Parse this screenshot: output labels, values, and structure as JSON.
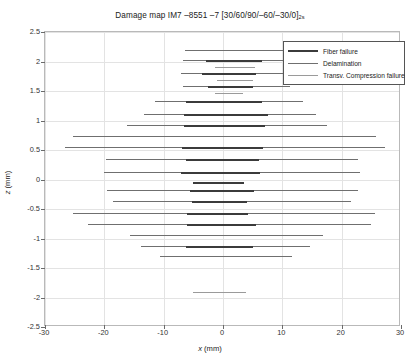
{
  "chart_data": {
    "type": "line",
    "title": "Damage map IM7 –8551 –7 [30/60/90/–60/–30/0]",
    "title_subscript": "2s",
    "xlabel": "x (mm)",
    "ylabel": "z (mm)",
    "xlim": [
      -30,
      30
    ],
    "ylim": [
      -2.5,
      2.5
    ],
    "xticks": [
      -30,
      -20,
      -10,
      0,
      10,
      20,
      30
    ],
    "yticks": [
      2.5,
      2,
      1.5,
      1,
      0.5,
      0,
      -0.5,
      -1,
      -1.5,
      -2,
      -2.5
    ],
    "xticklabels": [
      "-30",
      "-20",
      "-10",
      "0",
      "10",
      "20",
      "30"
    ],
    "yticklabels": [
      "2.5",
      "2",
      "1.5",
      "1",
      "0.5",
      "0",
      "-0.5",
      "-1",
      "-1.5",
      "-2",
      "-2.5"
    ],
    "grid": true,
    "legend_position": "upper right",
    "legend": [
      {
        "label": "Fiber failure",
        "key": "fiber",
        "color": "#3b3b3b",
        "width": 2
      },
      {
        "label": "Delamination",
        "key": "delam",
        "color": "#6f6f6f",
        "width": 1
      },
      {
        "label": "Transv. Compression failure",
        "key": "trans",
        "color": "#9a9a9a",
        "width": 1
      }
    ],
    "segments": [
      {
        "series": "delam",
        "z": 2.19,
        "x0": -6.4,
        "x1": 11.5
      },
      {
        "series": "delam",
        "z": 2.02,
        "x0": -6.7,
        "x1": 11.4
      },
      {
        "series": "fiber",
        "z": 2.02,
        "x0": -2.9,
        "x1": 6.5
      },
      {
        "series": "trans",
        "z": 1.9,
        "x0": -1.4,
        "x1": 5.4
      },
      {
        "series": "delam",
        "z": 1.8,
        "x0": -7.0,
        "x1": 11.3
      },
      {
        "series": "fiber",
        "z": 1.8,
        "x0": -3.6,
        "x1": 5.6
      },
      {
        "series": "trans",
        "z": 1.68,
        "x0": -1.0,
        "x1": 5.1
      },
      {
        "series": "delam",
        "z": 1.58,
        "x0": -6.8,
        "x1": 11.3
      },
      {
        "series": "fiber",
        "z": 1.58,
        "x0": -2.5,
        "x1": 5.1
      },
      {
        "series": "trans",
        "z": 1.47,
        "x0": -1.3,
        "x1": 3.3
      },
      {
        "series": "delam",
        "z": 1.33,
        "x0": -11.5,
        "x1": 13.5
      },
      {
        "series": "fiber",
        "z": 1.33,
        "x0": -6.3,
        "x1": 6.6
      },
      {
        "series": "delam",
        "z": 1.11,
        "x0": -13.3,
        "x1": 15.7
      },
      {
        "series": "fiber",
        "z": 1.11,
        "x0": -6.6,
        "x1": 7.6
      },
      {
        "series": "delam",
        "z": 0.92,
        "x0": -16.1,
        "x1": 17.5
      },
      {
        "series": "fiber",
        "z": 0.92,
        "x0": -6.5,
        "x1": 7.0
      },
      {
        "series": "delam",
        "z": 0.74,
        "x0": -25.3,
        "x1": 25.8
      },
      {
        "series": "delam",
        "z": 0.55,
        "x0": -26.6,
        "x1": 27.3
      },
      {
        "series": "fiber",
        "z": 0.55,
        "x0": -6.9,
        "x1": 6.7
      },
      {
        "series": "delam",
        "z": 0.34,
        "x0": -19.8,
        "x1": 22.8
      },
      {
        "series": "fiber",
        "z": 0.34,
        "x0": -6.3,
        "x1": 6.1
      },
      {
        "series": "delam",
        "z": 0.13,
        "x0": -20.0,
        "x1": 23.1
      },
      {
        "series": "fiber",
        "z": 0.13,
        "x0": -7.1,
        "x1": 6.2
      },
      {
        "series": "fiber",
        "z": -0.05,
        "x0": -5.0,
        "x1": 3.6
      },
      {
        "series": "delam",
        "z": -0.18,
        "x0": -19.6,
        "x1": 22.7
      },
      {
        "series": "fiber",
        "z": -0.18,
        "x0": -5.5,
        "x1": 5.3
      },
      {
        "series": "delam",
        "z": -0.37,
        "x0": -18.5,
        "x1": 21.5
      },
      {
        "series": "fiber",
        "z": -0.37,
        "x0": -5.2,
        "x1": 4.0
      },
      {
        "series": "delam",
        "z": -0.57,
        "x0": -25.2,
        "x1": 25.6
      },
      {
        "series": "fiber",
        "z": -0.57,
        "x0": -6.1,
        "x1": 4.2
      },
      {
        "series": "delam",
        "z": -0.76,
        "x0": -22.8,
        "x1": 24.9
      },
      {
        "series": "fiber",
        "z": -0.76,
        "x0": -6.0,
        "x1": 5.5
      },
      {
        "series": "delam",
        "z": -0.94,
        "x0": -15.6,
        "x1": 16.9
      },
      {
        "series": "delam",
        "z": -1.12,
        "x0": -13.9,
        "x1": 14.6
      },
      {
        "series": "fiber",
        "z": -1.12,
        "x0": -6.3,
        "x1": 5.0
      },
      {
        "series": "delam",
        "z": -1.3,
        "x0": -10.6,
        "x1": 11.6
      },
      {
        "series": "trans",
        "z": -1.9,
        "x0": -5.1,
        "x1": 3.9
      }
    ]
  }
}
